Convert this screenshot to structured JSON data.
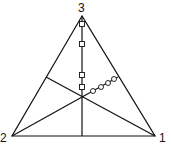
{
  "diagram": {
    "type": "ternary-triangle",
    "vertices": [
      {
        "label": "1",
        "x": 155,
        "y": 136
      },
      {
        "label": "2",
        "x": 12,
        "y": 136
      },
      {
        "label": "3",
        "x": 82,
        "y": 16
      }
    ],
    "centroid": {
      "x": 82,
      "y": 97
    },
    "square_markers": [
      {
        "x": 82,
        "y": 24
      },
      {
        "x": 82,
        "y": 44
      },
      {
        "x": 82,
        "y": 75
      },
      {
        "x": 82,
        "y": 87
      }
    ],
    "circle_markers": [
      {
        "x": 93,
        "y": 91
      },
      {
        "x": 101,
        "y": 87
      },
      {
        "x": 108,
        "y": 83
      },
      {
        "x": 114,
        "y": 79
      }
    ],
    "colors": {
      "line": "#111111",
      "background": "#ffffff"
    }
  }
}
